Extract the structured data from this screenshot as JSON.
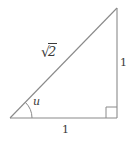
{
  "figure": {
    "type": "right-triangle-diagram",
    "stroke_color": "#8a8a8a",
    "text_color": "#3a3a3a",
    "background_color": "#ffffff",
    "geometry": {
      "left_vertex": [
        10,
        118
      ],
      "bottom_right_vertex": [
        117,
        118
      ],
      "top_right_vertex": [
        117,
        8
      ],
      "angle_arc_radius": 22,
      "right_angle_marker_size": 11
    },
    "labels": {
      "hypotenuse": {
        "radical": "√",
        "radicand": "2",
        "full_text": "√2"
      },
      "angle": "u",
      "vertical_leg": "1",
      "base_leg": "1"
    }
  }
}
